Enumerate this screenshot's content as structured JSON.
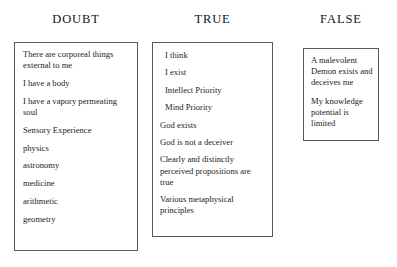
{
  "diagram": {
    "background_color": "#ffffff",
    "border_color": "#5a5a5a",
    "text_color": "#1d1d1d",
    "columns": [
      {
        "id": "doubt",
        "header": "DOUBT",
        "entries": [
          "There are corporeal things external to me",
          "I have a body",
          "I have a vapory permeating soul",
          "Sensory Experience",
          "physics",
          "astronomy",
          "medicine",
          "arithmetic",
          "geometry"
        ]
      },
      {
        "id": "true",
        "header": "TRUE",
        "entries": [
          "I think",
          "I exist",
          "Intellect Priority",
          "Mind Priority",
          "God exists",
          "God is not a deceiver",
          "Clearly and distinctly perceived propositions are true",
          "Various metaphysical principles"
        ]
      },
      {
        "id": "false",
        "header": "FALSE",
        "entries": [
          "A malevolent Demon exists and deceives me",
          "My knowledge potential is limited"
        ]
      }
    ]
  }
}
